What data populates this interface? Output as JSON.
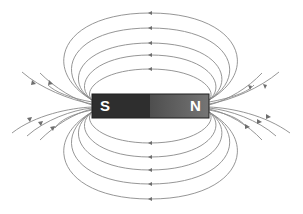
{
  "diagram": {
    "magnet": {
      "south_label": "S",
      "north_label": "N",
      "south_color": "#2e2e2e",
      "north_color_left": "#4a4a4a",
      "north_color_right": "#707070",
      "x": 92,
      "y": 94,
      "width": 117,
      "height": 24
    },
    "field_line_color": "#8a8a8a",
    "top_loops_apex_y": [
      13,
      28,
      43,
      55,
      69
    ],
    "bottom_loops_apex_y": [
      143,
      157,
      170,
      184,
      199
    ],
    "side_rays_per_side": 5,
    "arrow_direction": "N to S (outside magnet)"
  }
}
